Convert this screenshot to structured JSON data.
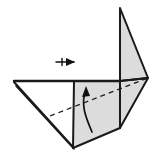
{
  "figure": {
    "title": "Origami folding step diagram",
    "canvas": {
      "width": 156,
      "height": 162
    },
    "colors": {
      "background": "#ffffff",
      "paper_front": "#ffffff",
      "paper_back": "#dcdcdc",
      "paper_back_dark": "#d2d2d2",
      "outline": "#1a1a1a",
      "crease_dashed": "#1a1a1a",
      "arrow": "#111111"
    },
    "shapes": [
      {
        "name": "left-white-flap",
        "kind": "polygon",
        "fill": "paper_front",
        "points": "14,81 74,81 74,140 71,147"
      },
      {
        "name": "left-white-flap-lower",
        "kind": "polygon",
        "fill": "paper_front",
        "points": "14,82 73,146 70,148"
      },
      {
        "name": "center-gray-panel",
        "kind": "polygon",
        "fill": "paper_back",
        "points": "74,81 120,81 120,128 73,148"
      },
      {
        "name": "right-gray-wing",
        "kind": "polygon",
        "fill": "paper_back",
        "points": "120,81 148,78 120,128"
      },
      {
        "name": "upper-gray-flap",
        "kind": "polygon",
        "fill": "paper_back",
        "points": "120,8 148,78 120,81"
      }
    ],
    "edges": [
      {
        "name": "top-horizontal-edge",
        "from": [
          14,
          81
        ],
        "to": [
          120,
          81
        ]
      },
      {
        "name": "left-slant-edge",
        "from": [
          14,
          82
        ],
        "to": [
          73,
          147
        ]
      },
      {
        "name": "left-slant-edge-shadow",
        "from": [
          16,
          86
        ],
        "to": [
          74,
          149
        ]
      },
      {
        "name": "panel-vertical-divider",
        "from": [
          74,
          81
        ],
        "to": [
          73,
          148
        ]
      },
      {
        "name": "panel-right-vertical",
        "from": [
          120,
          81
        ],
        "to": [
          120,
          128
        ]
      },
      {
        "name": "panel-bottom-edge",
        "from": [
          73,
          148
        ],
        "to": [
          120,
          128
        ]
      },
      {
        "name": "wing-outer-edge",
        "from": [
          120,
          81
        ],
        "to": [
          148,
          78
        ]
      },
      {
        "name": "wing-lower-edge",
        "from": [
          148,
          78
        ],
        "to": [
          120,
          128
        ]
      },
      {
        "name": "upper-flap-left-edge",
        "from": [
          120,
          8
        ],
        "to": [
          120,
          81
        ]
      },
      {
        "name": "upper-flap-right-edge",
        "from": [
          120,
          8
        ],
        "to": [
          148,
          78
        ]
      }
    ],
    "crease_lines": [
      {
        "name": "valley-fold-dashed-line",
        "style": "dashed",
        "from": [
          50,
          116
        ],
        "to": [
          148,
          78
        ]
      }
    ],
    "arrows": [
      {
        "name": "fold-up-curved-arrow",
        "kind": "curved",
        "direction": "up",
        "path": "M 92,132 C 86,118 80,104 86,90",
        "head_at": [
          86,
          88
        ],
        "head_angle_deg": -80
      },
      {
        "name": "push-right-straight-arrow",
        "kind": "straight-fletched",
        "direction": "right",
        "from": [
          56,
          62
        ],
        "to": [
          74,
          62
        ],
        "head_at": [
          74,
          62
        ]
      }
    ]
  }
}
